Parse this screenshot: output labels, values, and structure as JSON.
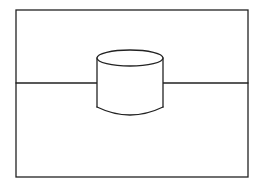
{
  "diagram": {
    "stroke_color": "#222222",
    "background_color": "#ffffff",
    "frame": {
      "x": 16,
      "y": 10,
      "width": 232,
      "height": 167
    },
    "horizon_line": {
      "y": 83
    },
    "cylinder": {
      "cx": 130,
      "top_cy": 58,
      "rx": 33,
      "ry": 8,
      "bottom_y": 107,
      "bottom_arc_y": 115
    }
  }
}
